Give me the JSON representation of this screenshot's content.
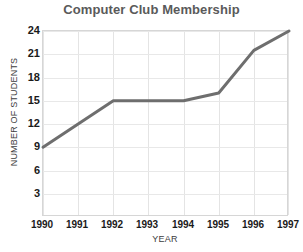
{
  "chart_data": {
    "type": "line",
    "title": "Computer Club Membership",
    "xlabel": "YEAR",
    "ylabel": "NUMBER OF STUDENTS",
    "categories": [
      "1990",
      "1991",
      "1992",
      "1993",
      "1994",
      "1995",
      "1996",
      "1997"
    ],
    "x": [
      1990,
      1991,
      1992,
      1993,
      1994,
      1995,
      1996,
      1997
    ],
    "values": [
      9,
      12,
      15,
      15,
      15,
      16,
      21.5,
      24
    ],
    "series": [
      {
        "name": "Members",
        "values": [
          9,
          12,
          15,
          15,
          15,
          16,
          21.5,
          24
        ],
        "color": "#6e6e6e"
      }
    ],
    "xtick_labels": [
      "1990",
      "1991",
      "1992",
      "1993",
      "1994",
      "1995",
      "1996",
      "1997"
    ],
    "ytick_labels": [
      "3",
      "6",
      "9",
      "12",
      "15",
      "18",
      "21",
      "24"
    ],
    "yticks": [
      3,
      6,
      9,
      12,
      15,
      18,
      21,
      24
    ],
    "ylim": [
      0,
      24
    ],
    "xlim": [
      1990,
      1997
    ],
    "grid": true,
    "legend": "none",
    "line_color": "#6e6e6e",
    "line_width": 3,
    "grid_color": "#e4e4e4",
    "frame_color": "#d6d6d6",
    "title_color": "#5a5a5a",
    "tick_color": "#1a1a1a",
    "background": "#ffffff"
  }
}
